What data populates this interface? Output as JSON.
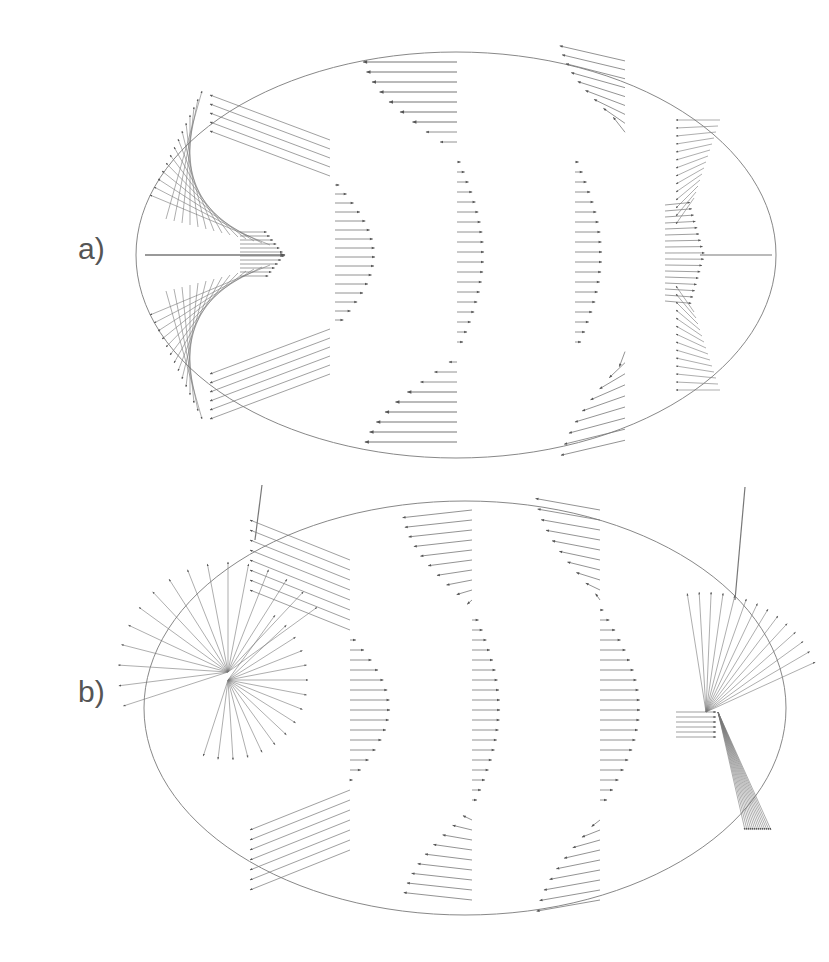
{
  "figure": {
    "panels": [
      {
        "label": "a)",
        "label_pos": [
          78,
          268
        ],
        "ellipse": {
          "cx": 456,
          "cy": 255,
          "rx": 320,
          "ry": 203
        },
        "description": "Symmetric velocity field: four columns of horizontal arrows with sinusoidal amplitude, converging cusps at left and right axis"
      },
      {
        "label": "b)",
        "label_pos": [
          78,
          710
        ],
        "ellipse": {
          "cx": 465,
          "cy": 708,
          "rx": 321,
          "ry": 207
        },
        "description": "Distorted velocity field with swirling arrows near left and right ends extending beyond boundary"
      }
    ],
    "colors": {
      "stroke": "#666666",
      "ellipse": "#888888",
      "label": "#555555",
      "background": "#ffffff"
    }
  }
}
